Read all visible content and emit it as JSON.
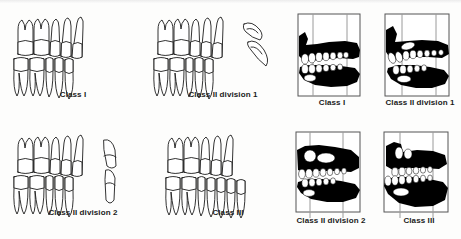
{
  "figure": {
    "background_color": "#fdfdfc",
    "ink_color": "#111111",
    "silhouette_color": "#000000",
    "tooth_fill_color": "#ffffff",
    "reference_line_color": "#8a8a8a",
    "panel_border_color": "#555555"
  },
  "left_column": {
    "description": "Line-drawn buccal views of occluding upper and lower teeth",
    "items": [
      {
        "id": "line-class-i",
        "label": "Class I",
        "has_separate_incisor": false,
        "separate_incisor_label": ""
      },
      {
        "id": "line-class-ii-div-1",
        "label": "Class II division 1",
        "has_separate_incisor": true,
        "separate_incisor_label": "proclined upper incisor"
      },
      {
        "id": "line-class-ii-div-2",
        "label": "Class II division 2",
        "has_separate_incisor": true,
        "separate_incisor_label": "retroclined upper incisor"
      },
      {
        "id": "line-class-iii",
        "label": "Class III",
        "has_separate_incisor": false,
        "separate_incisor_label": ""
      }
    ]
  },
  "right_column": {
    "description": "High-contrast black silhouette profile radiographic tracings with vertical reference lines",
    "items": [
      {
        "id": "photo-class-i",
        "label": "Class I",
        "reference_lines": 2
      },
      {
        "id": "photo-class-ii-div-1",
        "label": "Class II division 1",
        "reference_lines": 2
      },
      {
        "id": "photo-class-ii-div-2",
        "label": "Class II division 2",
        "reference_lines": 2
      },
      {
        "id": "photo-class-iii",
        "label": "Class III",
        "reference_lines": 2
      }
    ]
  }
}
